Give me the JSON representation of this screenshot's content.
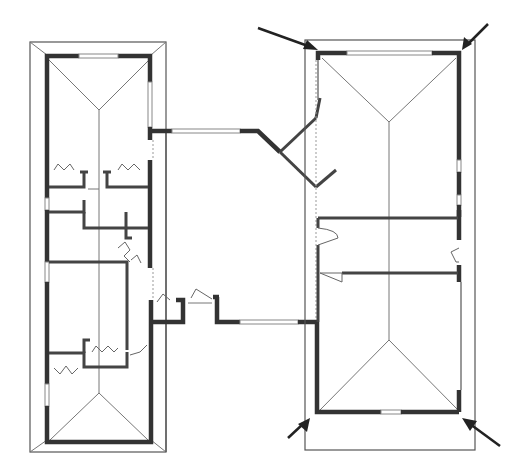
{
  "figure": {
    "type": "architectural floor plan",
    "header_ghost_text": ""
  },
  "buildings": [
    {
      "name": "left-wing",
      "outline": {
        "x": 30,
        "y": 42,
        "w": 136,
        "h": 410
      },
      "walls": {
        "x": 47,
        "y": 55,
        "w": 104,
        "h": 385
      },
      "roof_type": "hip",
      "rooms": [
        "upper-room",
        "central-rooms",
        "lower-room"
      ]
    },
    {
      "name": "right-wing",
      "outline": {
        "x": 305,
        "y": 40,
        "w": 170,
        "h": 410
      },
      "walls": {
        "x": 317,
        "y": 53,
        "w": 143,
        "h": 359
      },
      "roof_type": "hip",
      "rooms": [
        "upper-room",
        "middle-room-a",
        "middle-room-b",
        "lower-room"
      ]
    }
  ],
  "connector": {
    "name": "central-courtyard-passage",
    "notes": "angled walls at top, stepped walls with doors at bottom"
  },
  "arrows": [
    {
      "name": "arrow-top-left",
      "from": [
        258,
        28
      ],
      "to": [
        318,
        50
      ]
    },
    {
      "name": "arrow-top-right",
      "from": [
        488,
        24
      ],
      "to": [
        462,
        50
      ]
    },
    {
      "name": "arrow-bottom-left",
      "from": [
        288,
        438
      ],
      "to": [
        310,
        418
      ]
    },
    {
      "name": "arrow-bottom-right",
      "from": [
        500,
        446
      ],
      "to": [
        462,
        418
      ]
    }
  ]
}
